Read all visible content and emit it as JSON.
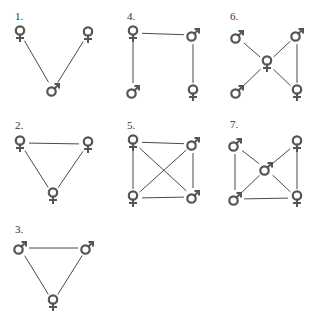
{
  "colors": {
    "background": "#ffffff",
    "edge": "#4a4a4a",
    "symbol": "#555555",
    "label": "#333333"
  },
  "legend_symbols": {
    "female": "female-symbol-icon",
    "male": "male-symbol-icon"
  },
  "diagrams": [
    {
      "id": "1",
      "label": "1.",
      "label_pos": [
        15,
        20
      ],
      "nodes": [
        {
          "id": "a",
          "sex": "female",
          "x": 20,
          "y": 33
        },
        {
          "id": "b",
          "sex": "female",
          "x": 88,
          "y": 34
        },
        {
          "id": "c",
          "sex": "male",
          "x": 53,
          "y": 90
        }
      ],
      "edges": [
        [
          "a",
          "c"
        ],
        [
          "b",
          "c"
        ]
      ]
    },
    {
      "id": "4",
      "label": "4.",
      "label_pos": [
        127,
        20
      ],
      "nodes": [
        {
          "id": "tl",
          "sex": "female",
          "x": 133,
          "y": 33
        },
        {
          "id": "tr",
          "sex": "male",
          "x": 193,
          "y": 35
        },
        {
          "id": "bl",
          "sex": "male",
          "x": 133,
          "y": 92
        },
        {
          "id": "br",
          "sex": "female",
          "x": 193,
          "y": 92
        }
      ],
      "edges": [
        [
          "tl",
          "tr"
        ],
        [
          "tl",
          "bl"
        ],
        [
          "tr",
          "br"
        ]
      ]
    },
    {
      "id": "6",
      "label": "6.",
      "label_pos": [
        230,
        20
      ],
      "nodes": [
        {
          "id": "tl",
          "sex": "male",
          "x": 237,
          "y": 37
        },
        {
          "id": "tr",
          "sex": "male",
          "x": 297,
          "y": 35
        },
        {
          "id": "c",
          "sex": "female",
          "x": 267,
          "y": 63
        },
        {
          "id": "bl",
          "sex": "male",
          "x": 237,
          "y": 92
        },
        {
          "id": "br",
          "sex": "female",
          "x": 297,
          "y": 92
        }
      ],
      "edges": [
        [
          "tl",
          "c"
        ],
        [
          "tr",
          "c"
        ],
        [
          "bl",
          "c"
        ],
        [
          "br",
          "c"
        ],
        [
          "tr",
          "br"
        ]
      ]
    },
    {
      "id": "2",
      "label": "2.",
      "label_pos": [
        15,
        129
      ],
      "nodes": [
        {
          "id": "a",
          "sex": "female",
          "x": 20,
          "y": 143
        },
        {
          "id": "b",
          "sex": "female",
          "x": 88,
          "y": 144
        },
        {
          "id": "c",
          "sex": "female",
          "x": 53,
          "y": 195
        }
      ],
      "edges": [
        [
          "a",
          "b"
        ],
        [
          "a",
          "c"
        ],
        [
          "b",
          "c"
        ]
      ]
    },
    {
      "id": "5",
      "label": "5.",
      "label_pos": [
        127,
        129
      ],
      "nodes": [
        {
          "id": "tl",
          "sex": "female",
          "x": 133,
          "y": 142
        },
        {
          "id": "tr",
          "sex": "male",
          "x": 193,
          "y": 144
        },
        {
          "id": "bl",
          "sex": "female",
          "x": 133,
          "y": 198
        },
        {
          "id": "br",
          "sex": "male",
          "x": 193,
          "y": 197
        }
      ],
      "edges": [
        [
          "tl",
          "tr"
        ],
        [
          "tl",
          "bl"
        ],
        [
          "tl",
          "br"
        ],
        [
          "tr",
          "bl"
        ],
        [
          "tr",
          "br"
        ],
        [
          "bl",
          "br"
        ]
      ]
    },
    {
      "id": "7",
      "label": "7.",
      "label_pos": [
        230,
        128
      ],
      "nodes": [
        {
          "id": "tl",
          "sex": "male",
          "x": 235,
          "y": 145
        },
        {
          "id": "tr",
          "sex": "female",
          "x": 297,
          "y": 143
        },
        {
          "id": "c",
          "sex": "male",
          "x": 266,
          "y": 169
        },
        {
          "id": "bl",
          "sex": "male",
          "x": 235,
          "y": 199
        },
        {
          "id": "br",
          "sex": "female",
          "x": 297,
          "y": 198
        }
      ],
      "edges": [
        [
          "tl",
          "c"
        ],
        [
          "tr",
          "c"
        ],
        [
          "bl",
          "c"
        ],
        [
          "br",
          "c"
        ],
        [
          "tl",
          "bl"
        ],
        [
          "bl",
          "br"
        ],
        [
          "tr",
          "br"
        ]
      ]
    },
    {
      "id": "3",
      "label": "3.",
      "label_pos": [
        15,
        233
      ],
      "nodes": [
        {
          "id": "a",
          "sex": "male",
          "x": 20,
          "y": 248
        },
        {
          "id": "b",
          "sex": "male",
          "x": 87,
          "y": 248
        },
        {
          "id": "c",
          "sex": "female",
          "x": 53,
          "y": 302
        }
      ],
      "edges": [
        [
          "a",
          "b"
        ],
        [
          "a",
          "c"
        ],
        [
          "b",
          "c"
        ]
      ]
    }
  ]
}
